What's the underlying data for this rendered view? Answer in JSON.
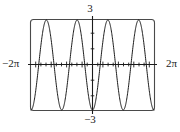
{
  "figure": {
    "name": "trigonometric-function-graph",
    "background_color": "#ffffff",
    "curve_color": "#1b1b1b",
    "axis_color": "#1b1b1b",
    "frame_color": "#4a4a4a"
  },
  "labels": {
    "y_max": "3",
    "y_min": "−3",
    "x_min": "−2π",
    "x_max": "2π"
  },
  "chart_data": {
    "type": "line",
    "title": "",
    "xlabel": "",
    "ylabel": "",
    "function": "y = -3cos(2x)",
    "amplitude": 3,
    "period": 3.14159,
    "cycles_shown": 4,
    "xlim": [
      -6.28319,
      6.28319
    ],
    "ylim": [
      -3,
      3
    ],
    "xtick_labels": [
      "−2π",
      "2π"
    ],
    "ytick_labels": [
      "−3",
      "3"
    ],
    "x_tick_spacing": 0.5235988,
    "y_tick_spacing": 1,
    "grid": false,
    "legend": null,
    "x": [
      -6.28319,
      -6.10865,
      -5.93412,
      -5.75959,
      -5.58505,
      -5.41052,
      -5.23599,
      -5.06145,
      -4.88692,
      -4.71239,
      -4.53786,
      -4.36332,
      -4.18879,
      -4.01426,
      -3.83972,
      -3.66519,
      -3.49066,
      -3.31613,
      -3.14159,
      -2.96706,
      -2.79253,
      -2.61799,
      -2.44346,
      -2.26893,
      -2.0944,
      -1.91986,
      -1.74533,
      -1.5708,
      -1.39626,
      -1.22173,
      -1.0472,
      -0.87266,
      -0.69813,
      -0.5236,
      -0.34907,
      -0.17453,
      0,
      0.17453,
      0.34907,
      0.5236,
      0.69813,
      0.87266,
      1.0472,
      1.22173,
      1.39626,
      1.5708,
      1.74533,
      1.91986,
      2.0944,
      2.26893,
      2.44346,
      2.61799,
      2.79253,
      2.96706,
      3.14159,
      3.31613,
      3.49066,
      3.66519,
      3.83972,
      4.01426,
      4.18879,
      4.36332,
      4.53786,
      4.71239,
      4.88692,
      5.06145,
      5.23599,
      5.41052,
      5.58505,
      5.75959,
      5.93412,
      6.10865,
      6.28319
    ],
    "y": [
      -3,
      -2.9,
      -2.6,
      -2.12,
      -1.5,
      -0.78,
      0,
      0.78,
      1.5,
      2.12,
      2.6,
      2.9,
      3,
      2.9,
      2.6,
      2.12,
      1.5,
      0.78,
      0,
      -0.78,
      -1.5,
      -2.12,
      -2.6,
      -2.9,
      -3,
      -2.9,
      -2.6,
      -2.12,
      -1.5,
      -0.78,
      0,
      0.78,
      1.5,
      2.12,
      2.6,
      2.9,
      -3,
      2.9,
      2.6,
      2.12,
      1.5,
      0.78,
      0,
      -0.78,
      -1.5,
      -2.12,
      -2.6,
      -2.9,
      -3,
      -2.9,
      -2.6,
      -2.12,
      -1.5,
      -0.78,
      0,
      0.78,
      1.5,
      2.12,
      2.6,
      2.9,
      3,
      2.9,
      2.6,
      2.12,
      1.5,
      0.78,
      0,
      -0.78,
      -1.5,
      -2.12,
      -2.6,
      -2.9,
      -3
    ]
  }
}
